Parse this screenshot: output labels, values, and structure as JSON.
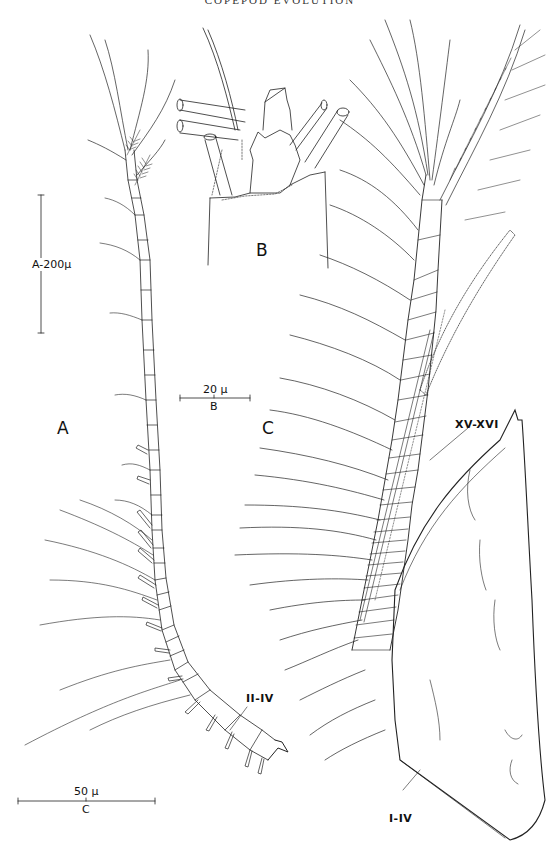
{
  "page": {
    "running_header": "COPEPOD EVOLUTION",
    "page_number": ""
  },
  "figure": {
    "panels": [
      {
        "id": "A",
        "label": "A",
        "description": "antennule, whole"
      },
      {
        "id": "B",
        "label": "B",
        "description": "distal segment detail"
      },
      {
        "id": "C",
        "label": "C",
        "description": "antennule, proximal segments"
      }
    ],
    "scale_bars": [
      {
        "panel": "A",
        "value": "200",
        "unit": "μ",
        "text": "A-200μ",
        "orientation": "vertical"
      },
      {
        "panel": "B",
        "value": "20",
        "unit": "μ",
        "text": "20 μ",
        "sub": "B",
        "orientation": "horizontal"
      },
      {
        "panel": "C",
        "value": "50",
        "unit": "μ",
        "text": "50 μ",
        "sub": "C",
        "orientation": "horizontal"
      }
    ],
    "segment_labels": [
      {
        "panel": "A",
        "text": "II-IV"
      },
      {
        "panel": "C",
        "text": "XV-XVI"
      },
      {
        "panel": "C",
        "text": "I-IV"
      }
    ]
  }
}
